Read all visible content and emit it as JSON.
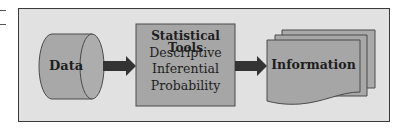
{
  "diagram": {
    "type": "flow",
    "nodes": [
      {
        "id": "data",
        "shape": "cylinder",
        "label": "Data"
      },
      {
        "id": "tools",
        "shape": "rectangle",
        "title": "Statistical Tools",
        "lines": [
          "Descriptive",
          "Inferential",
          "Probability"
        ]
      },
      {
        "id": "information",
        "shape": "document-stack",
        "label": "Information"
      }
    ],
    "edges": [
      {
        "from": "data",
        "to": "tools"
      },
      {
        "from": "tools",
        "to": "information"
      }
    ],
    "colors": {
      "frame_fill": "#e1e1e1",
      "frame_border": "#3a3a3a",
      "shape_fill": "#a6a6a6",
      "shape_stroke": "#4a4a4a",
      "arrow": "#333333",
      "text": "#1e1e1e"
    }
  }
}
